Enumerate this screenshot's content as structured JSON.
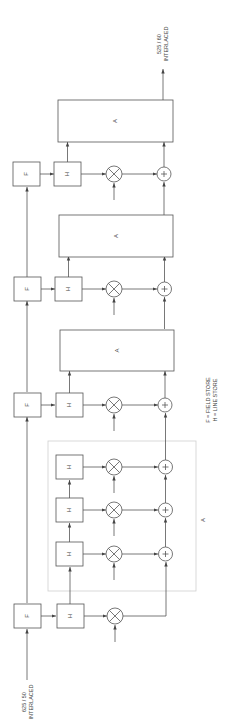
{
  "diagram": {
    "input_label": [
      "625 / 50",
      "INTERLACED"
    ],
    "output_label": [
      "525 / 60",
      "INTERLACED"
    ],
    "legend": [
      "F = FIELD STORE",
      "H = LINE STORE"
    ],
    "field_store_label": "F",
    "line_store_label": "H",
    "accumulator_label": "A",
    "group_label": "A",
    "multiplier_symbol": "×",
    "adder_symbol": "+"
  }
}
